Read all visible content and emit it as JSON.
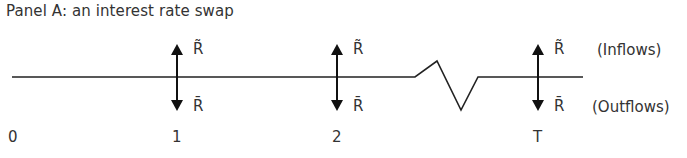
{
  "title": "Panel A: an interest rate swap",
  "labels": {
    "inflow_symbol": "R̃",
    "outflow_symbol": "R̄",
    "inflows": "(Inflows)",
    "outflows": "(Outflows)"
  },
  "ticks": [
    "0",
    "1",
    "2",
    "T"
  ],
  "colors": {
    "line": "#222222",
    "text": "#333333"
  }
}
